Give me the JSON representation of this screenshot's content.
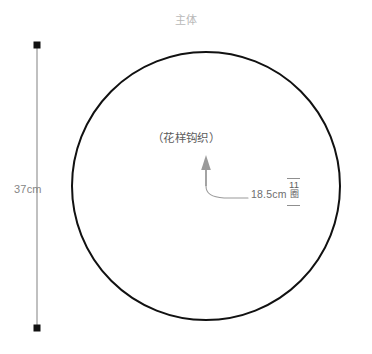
{
  "title": "主体",
  "shape": {
    "kind": "circle",
    "stroke_color": "#111111"
  },
  "labels": {
    "pattern": "（花样钩织）",
    "height_dimension": "37cm",
    "radius_dimension": "18.5cm"
  },
  "rounds_marker": {
    "count": "11",
    "unit": "圈"
  },
  "colors": {
    "outline": "#111111",
    "title_text": "#b9b9b9",
    "dimension_text": "#868686",
    "pattern_text": "#5c5c5c",
    "leader_line": "#9a9a9a",
    "dimension_line": "#8c8c8c",
    "background": "#ffffff"
  }
}
